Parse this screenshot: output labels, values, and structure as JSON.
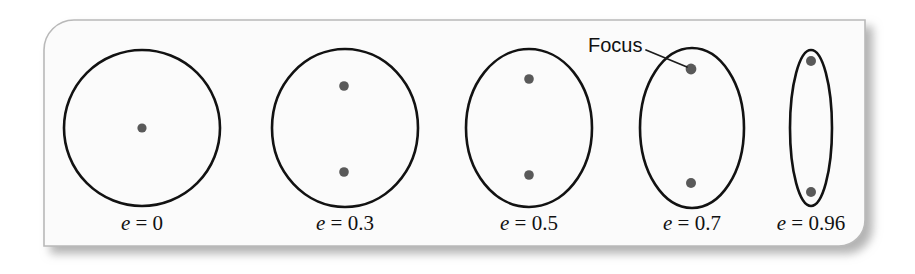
{
  "figure": {
    "name": "orbital-eccentricity-diagram",
    "background_color": "#ffffff",
    "panel": {
      "fill": "#fbfbfb",
      "border_color": "#b9b9b9",
      "shadow_color": "#b0b0b0",
      "x": 44,
      "y": 20,
      "width": 821,
      "height": 226,
      "corner_radius_top_left": 30,
      "corner_radius_bottom_right": 26
    },
    "stroke_color": "#121212",
    "dot_color": "#595959",
    "annotation": {
      "label": "Focus",
      "label_x": 588,
      "label_y": 52,
      "leader_from_x": 646,
      "leader_from_y": 50,
      "leader_to_x": 687,
      "leader_to_y": 67
    },
    "label_baseline_y": 230,
    "orbits": [
      {
        "id": "orbit-e0",
        "label": "e = 0",
        "label_var": "e",
        "label_rest": " = 0",
        "eccentricity": 0,
        "center_x": 142,
        "center_y": 128,
        "radius_x": 78,
        "radius_y": 78,
        "foci": [
          {
            "x": 142,
            "y": 128,
            "r": 4.6
          }
        ]
      },
      {
        "id": "orbit-e03",
        "label": "e = 0.3",
        "label_var": "e",
        "label_rest": " = 0.3",
        "eccentricity": 0.3,
        "center_x": 345,
        "center_y": 128,
        "radius_x": 73,
        "radius_y": 79,
        "foci": [
          {
            "x": 344,
            "y": 86,
            "r": 4.8
          },
          {
            "x": 344,
            "y": 172,
            "r": 4.8
          }
        ]
      },
      {
        "id": "orbit-e05",
        "label": "e = 0.5",
        "label_var": "e",
        "label_rest": " = 0.5",
        "eccentricity": 0.5,
        "center_x": 529,
        "center_y": 128,
        "radius_x": 63,
        "radius_y": 79,
        "foci": [
          {
            "x": 529,
            "y": 79,
            "r": 4.8
          },
          {
            "x": 529,
            "y": 175,
            "r": 4.8
          }
        ]
      },
      {
        "id": "orbit-e07",
        "label": "e = 0.7",
        "label_var": "e",
        "label_rest": " = 0.7",
        "eccentricity": 0.7,
        "center_x": 692,
        "center_y": 128,
        "radius_x": 52,
        "radius_y": 80,
        "foci": [
          {
            "x": 691,
            "y": 69,
            "r": 5.4
          },
          {
            "x": 691,
            "y": 183,
            "r": 5.0
          }
        ]
      },
      {
        "id": "orbit-e096",
        "label": "e = 0.96",
        "label_var": "e",
        "label_rest": " = 0.96",
        "eccentricity": 0.96,
        "center_x": 811,
        "center_y": 128,
        "radius_x": 21,
        "radius_y": 78,
        "foci": [
          {
            "x": 811,
            "y": 61,
            "r": 5.0
          },
          {
            "x": 811,
            "y": 192,
            "r": 5.0
          }
        ]
      }
    ]
  }
}
